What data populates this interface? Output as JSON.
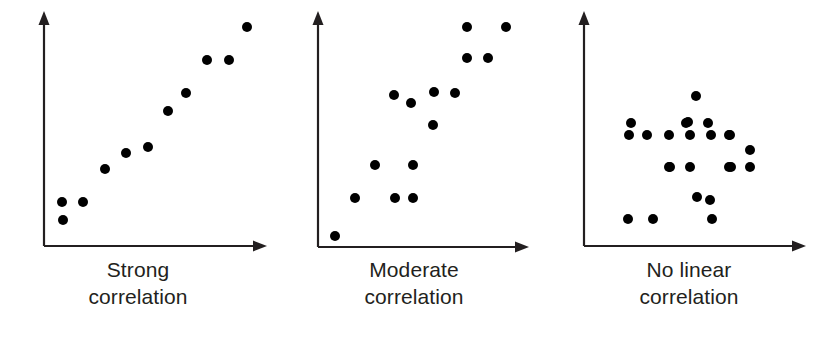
{
  "figure": {
    "background_color": "#ffffff",
    "axis_color": "#231f20",
    "point_color": "#000000",
    "caption_color": "#231f20"
  },
  "panels": [
    {
      "id": "strong",
      "caption": "Strong\ncorrelation",
      "caption_line1": "Strong",
      "caption_line2": "correlation"
    },
    {
      "id": "moderate",
      "caption": "Moderate\ncorrelation",
      "caption_line1": "Moderate",
      "caption_line2": "correlation"
    },
    {
      "id": "no-linear",
      "caption": "No linear\ncorrelation",
      "caption_line1": "No linear",
      "caption_line2": "correlation"
    }
  ],
  "chart_data": [
    {
      "type": "scatter",
      "title": "Strong correlation",
      "xlabel": "",
      "ylabel": "",
      "xlim": [
        0,
        276
      ],
      "ylim": [
        0,
        258
      ],
      "grid": false,
      "legend": "none",
      "axes": {
        "y_axis": {
          "x": 44,
          "y_top": 14,
          "y_bottom": 246,
          "arrow": "up"
        },
        "x_axis": {
          "y": 246,
          "x_left": 44,
          "x_right": 266,
          "arrow": "right"
        }
      },
      "point_radius": 5,
      "n_points": 11,
      "points": [
        {
          "x": 19,
          "y": 26
        },
        {
          "x": 39,
          "y": 44
        },
        {
          "x": 18,
          "y": 44
        },
        {
          "x": 61,
          "y": 77
        },
        {
          "x": 82,
          "y": 93
        },
        {
          "x": 104,
          "y": 99
        },
        {
          "x": 124,
          "y": 135
        },
        {
          "x": 142,
          "y": 153
        },
        {
          "x": 163,
          "y": 186
        },
        {
          "x": 185,
          "y": 186
        },
        {
          "x": 203,
          "y": 219
        }
      ]
    },
    {
      "type": "scatter",
      "title": "Moderate correlation",
      "xlabel": "",
      "ylabel": "",
      "xlim": [
        0,
        276
      ],
      "ylim": [
        0,
        258
      ],
      "grid": false,
      "legend": "none",
      "axes": {
        "y_axis": {
          "x": 42,
          "y_top": 14,
          "y_bottom": 247,
          "arrow": "up"
        },
        "x_axis": {
          "y": 247,
          "x_left": 42,
          "x_right": 252,
          "arrow": "right"
        }
      },
      "point_radius": 5,
      "n_points": 16,
      "points": [
        {
          "x": 17,
          "y": 11
        },
        {
          "x": 37,
          "y": 49
        },
        {
          "x": 57,
          "y": 82
        },
        {
          "x": 77,
          "y": 49
        },
        {
          "x": 95,
          "y": 49
        },
        {
          "x": 95,
          "y": 82
        },
        {
          "x": 76,
          "y": 152
        },
        {
          "x": 93,
          "y": 144
        },
        {
          "x": 115,
          "y": 122
        },
        {
          "x": 116,
          "y": 155
        },
        {
          "x": 137,
          "y": 154
        },
        {
          "x": 149,
          "y": 189
        },
        {
          "x": 149,
          "y": 220
        },
        {
          "x": 170,
          "y": 189
        },
        {
          "x": 188,
          "y": 220
        }
      ]
    },
    {
      "type": "scatter",
      "title": "No linear correlation",
      "xlabel": "",
      "ylabel": "",
      "xlim": [
        0,
        276
      ],
      "ylim": [
        0,
        258
      ],
      "grid": false,
      "legend": "none",
      "axes": {
        "y_axis": {
          "x": 33,
          "y_top": 14,
          "y_bottom": 246,
          "arrow": "up"
        },
        "x_axis": {
          "y": 246,
          "x_left": 33,
          "x_right": 255,
          "arrow": "right"
        }
      },
      "point_radius": 5,
      "n_points": 24,
      "points": [
        {
          "x": 44,
          "y": 27
        },
        {
          "x": 85,
          "y": 79
        },
        {
          "x": 113,
          "y": 49
        },
        {
          "x": 128,
          "y": 27
        },
        {
          "x": 145,
          "y": 79
        },
        {
          "x": 166,
          "y": 79
        },
        {
          "x": 85,
          "y": 111
        },
        {
          "x": 104,
          "y": 124
        },
        {
          "x": 124,
          "y": 123
        },
        {
          "x": 145,
          "y": 111
        },
        {
          "x": 166,
          "y": 96
        },
        {
          "x": 112,
          "y": 150
        },
        {
          "x": 47,
          "y": 123
        },
        {
          "x": 102,
          "y": 123
        },
        {
          "x": 45,
          "y": 111
        },
        {
          "x": 63,
          "y": 111
        },
        {
          "x": 106,
          "y": 111
        },
        {
          "x": 127,
          "y": 111
        },
        {
          "x": 146,
          "y": 111
        },
        {
          "x": 86,
          "y": 79
        },
        {
          "x": 106,
          "y": 79
        },
        {
          "x": 147,
          "y": 79
        },
        {
          "x": 126,
          "y": 46
        },
        {
          "x": 69,
          "y": 27
        }
      ]
    }
  ]
}
